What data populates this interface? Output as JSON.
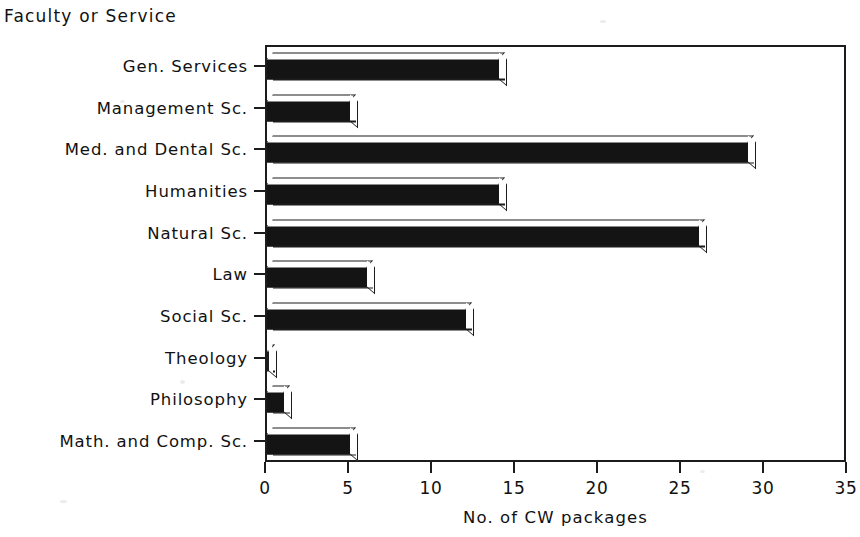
{
  "chart_data": {
    "type": "bar",
    "orientation": "horizontal",
    "title": "",
    "xlabel": "No. of CW packages",
    "ylabel": "Faculty or Service",
    "categories": [
      "Gen. Services",
      "Management Sc.",
      "Med. and Dental Sc.",
      "Humanities",
      "Natural Sc.",
      "Law",
      "Social Sc.",
      "Theology",
      "Philosophy",
      "Math. and Comp. Sc."
    ],
    "values": [
      14,
      5,
      29,
      14,
      26,
      6,
      12,
      0,
      1,
      5
    ],
    "xlim": [
      0,
      35
    ],
    "xticks": [
      0,
      5,
      10,
      15,
      20,
      25,
      30,
      35
    ],
    "xtick_labels": [
      "0",
      "5",
      "10",
      "15",
      "20",
      "25",
      "30",
      "35"
    ],
    "grid": false,
    "legend": false,
    "style": "3d-shaded-bars",
    "bar_color": "#141414",
    "axis_color": "#1c1c1c",
    "background": "#ffffff"
  },
  "axis_titles": {
    "y": "Faculty or Service",
    "x": "No. of CW packages"
  }
}
